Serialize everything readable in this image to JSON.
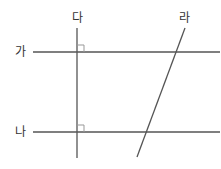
{
  "labels": {
    "ga": "가",
    "na": "나",
    "da": "다",
    "ra": "라"
  },
  "colors": {
    "line": "#555555",
    "right_angle_mark": "#999999",
    "text": "#333333",
    "background": "#ffffff"
  },
  "lines": {
    "ga": {
      "x1": 33,
      "y1": 52,
      "x2": 220,
      "y2": 52
    },
    "na": {
      "x1": 33,
      "y1": 132,
      "x2": 220,
      "y2": 132
    },
    "da": {
      "x1": 77,
      "y1": 28,
      "x2": 77,
      "y2": 158
    },
    "ra": {
      "x1": 185,
      "y1": 28,
      "x2": 137,
      "y2": 157
    }
  },
  "right_angles": [
    {
      "at": "ga-da",
      "x": 77,
      "y": 52,
      "size": 7
    },
    {
      "at": "na-da",
      "x": 77,
      "y": 132,
      "size": 7
    }
  ]
}
